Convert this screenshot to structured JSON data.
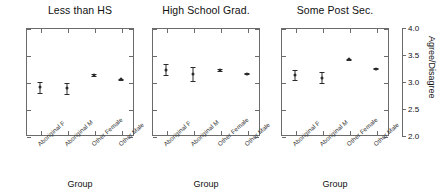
{
  "chart_data": {
    "type": "scatter",
    "title": "",
    "xlabel": "Group",
    "ylabel": "Agree/Disagree",
    "ylim": [
      2.0,
      4.0
    ],
    "yticks": [
      "2.0",
      "2.5",
      "3.0",
      "3.5",
      "4.0"
    ],
    "grid": false,
    "legend": "none",
    "categories": [
      "Aboriginal F",
      "Aboriginal M",
      "Other Female",
      "Other Male"
    ],
    "panels": [
      {
        "title": "Less than HS",
        "xlabel": "Group",
        "categories": [
          "Aboriginal F",
          "Aboriginal M",
          "Other Female",
          "Other Male"
        ],
        "values": [
          2.9,
          2.88,
          3.13,
          3.05
        ],
        "err_low": [
          2.8,
          2.78,
          3.11,
          3.04
        ],
        "err_high": [
          3.0,
          2.98,
          3.15,
          3.06
        ]
      },
      {
        "title": "High School Grad.",
        "xlabel": "Group",
        "categories": [
          "Aboriginal F",
          "Aboriginal M",
          "Other Female",
          "Other Male"
        ],
        "values": [
          3.23,
          3.14,
          3.22,
          3.15
        ],
        "err_low": [
          3.13,
          3.01,
          3.2,
          3.14
        ],
        "err_high": [
          3.33,
          3.27,
          3.24,
          3.16
        ]
      },
      {
        "title": "Some Post Sec.",
        "xlabel": "Group",
        "categories": [
          "Aboriginal F",
          "Aboriginal M",
          "Other Female",
          "Other Male"
        ],
        "values": [
          3.13,
          3.08,
          3.42,
          3.25
        ],
        "err_low": [
          3.03,
          2.98,
          3.41,
          3.24
        ],
        "err_high": [
          3.23,
          3.18,
          3.43,
          3.26
        ]
      }
    ]
  },
  "axis": {
    "y_title": "Agree/Disagree",
    "y_tick_labels": [
      "4.0",
      "3.5",
      "3.0",
      "2.5",
      "2.0"
    ],
    "x_title": "Group"
  },
  "colors": {
    "marker": "#2b2b2b",
    "frame": "#6b6b6b",
    "background": "#ffffff",
    "text": "#111111"
  }
}
